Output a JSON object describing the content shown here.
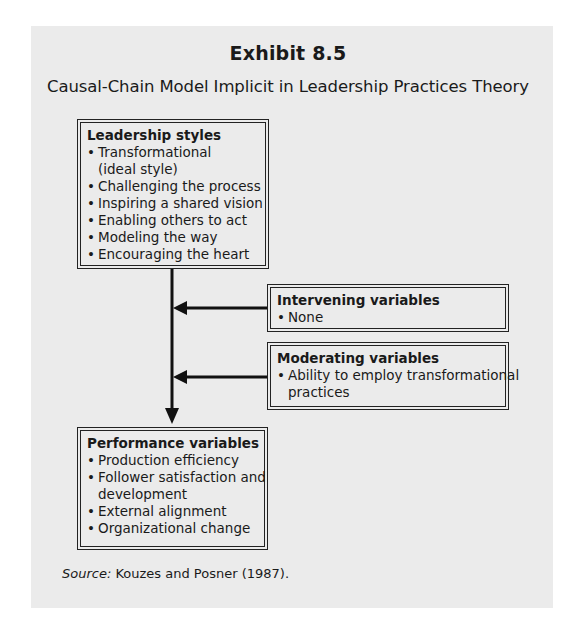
{
  "exhibit": {
    "title": "Exhibit 8.5",
    "subtitle": "Causal-Chain Model Implicit in Leadership Practices Theory"
  },
  "boxes": {
    "leadership": {
      "heading": "Leadership styles",
      "items": [
        {
          "text": "Transformational",
          "continuation": "(ideal style)"
        },
        {
          "text": "Challenging the process"
        },
        {
          "text": "Inspiring a shared vision"
        },
        {
          "text": "Enabling others to act"
        },
        {
          "text": "Modeling the way"
        },
        {
          "text": "Encouraging the heart"
        }
      ]
    },
    "intervening": {
      "heading": "Intervening variables",
      "items": [
        {
          "text": "None"
        }
      ]
    },
    "moderating": {
      "heading": "Moderating variables",
      "items": [
        {
          "text": "Ability to employ transformational",
          "continuation": "practices"
        }
      ]
    },
    "performance": {
      "heading": "Performance variables",
      "items": [
        {
          "text": "Production efficiency"
        },
        {
          "text": "Follower satisfaction and",
          "continuation": "development"
        },
        {
          "text": "External alignment"
        },
        {
          "text": "Organizational change"
        }
      ]
    }
  },
  "bullet_glyph": "•",
  "source": {
    "label": "Source:",
    "text": " Kouzes and Posner (1987)."
  },
  "colors": {
    "panel_bg": "#ebebeb",
    "ink": "#1a1a1a"
  }
}
